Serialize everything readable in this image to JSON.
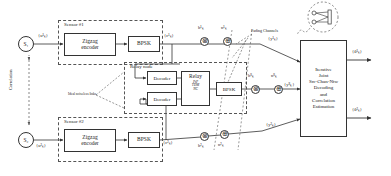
{
  "diagram": {
    "sensors": [
      {
        "group_label": "Sensor #1",
        "source_node": "S₁",
        "input_label": "{u¹ₖ}",
        "encoder_label_line1": "Zigzag",
        "encoder_label_line2": "encoder",
        "modulator_label": "BPSK",
        "output_label": "{c¹ₖ}"
      },
      {
        "group_label": "Sensor #2",
        "source_node": "S₂",
        "input_label": "{u²ₖ}",
        "encoder_label_line1": "Zigzag",
        "encoder_label_line2": "encoder",
        "modulator_label": "BPSK",
        "output_label": "{c²ₖ}"
      }
    ],
    "correlation_label": "Correlation",
    "relay": {
      "group_label": "Relay node",
      "decoder_label_top": "Decoder",
      "decoder_label_bottom": "Decoder",
      "relay_box_label": "Relay",
      "relay_modes": [
        "PtP",
        "TDM",
        "NC"
      ],
      "modulator_label": "BPSK",
      "ideal_link_label": "Ideal noiseless links"
    },
    "channels": {
      "fading_label": "Fading Channels",
      "branch1": {
        "gain": "h¹ₖ",
        "noise": "n¹ₖ",
        "output": "{y¹ₖ}"
      },
      "branch_relay": {
        "gain": "hᴿₖ",
        "noise": "nᴿₖ",
        "output": "{yᴿₖ}"
      },
      "branch2": {
        "gain": "h²ₖ",
        "noise": "n²ₖ",
        "output": "{y²ₖ}"
      },
      "multiply_glyph": "⊗",
      "add_glyph": "⊕"
    },
    "destination": {
      "antenna_icon": "receive-antenna-icon",
      "lines": [
        "Iterative",
        "Joint",
        "Src-Chan-Ntw",
        "Decoding",
        "and",
        "Correlation",
        "Estimation"
      ],
      "outputs": [
        "{û¹ₖ}",
        "{û²ₖ}"
      ]
    },
    "colors": {
      "line": "#333333",
      "dashed": "#555555",
      "background": "#ffffff",
      "text": "#1a1a1a"
    }
  }
}
